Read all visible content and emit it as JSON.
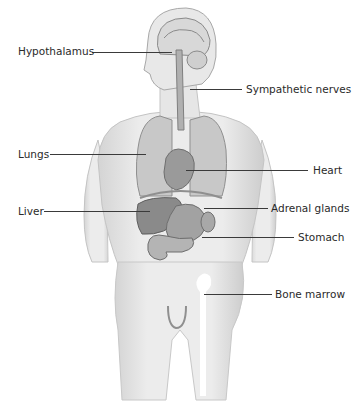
{
  "diagram": {
    "colors": {
      "skin": "#e9e9e9",
      "skin_shade": "#cfcfcf",
      "organ": "#9a9a9a",
      "organ_dark": "#7d7d7d",
      "line": "#3a3a3a"
    },
    "labels": [
      {
        "id": "hypothalamus",
        "text": "Hypothalamus",
        "side": "left"
      },
      {
        "id": "sympathetic-nerves",
        "text": "Sympathetic nerves",
        "side": "right"
      },
      {
        "id": "lungs",
        "text": "Lungs",
        "side": "left"
      },
      {
        "id": "heart",
        "text": "Heart",
        "side": "right"
      },
      {
        "id": "liver",
        "text": "Liver",
        "side": "left"
      },
      {
        "id": "adrenal-glands",
        "text": "Adrenal glands",
        "side": "right"
      },
      {
        "id": "stomach",
        "text": "Stomach",
        "side": "right"
      },
      {
        "id": "bone-marrow",
        "text": "Bone marrow",
        "side": "right"
      }
    ]
  }
}
